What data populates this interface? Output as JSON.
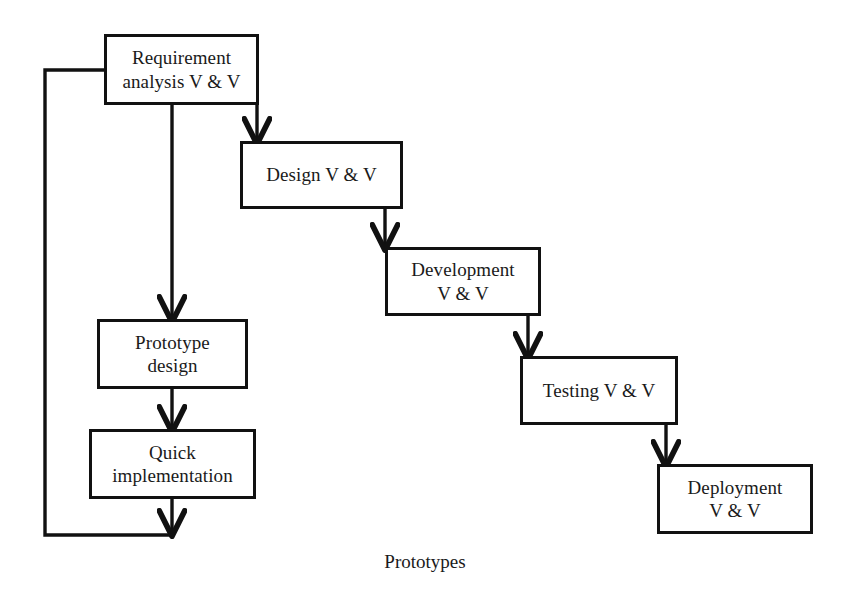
{
  "diagram": {
    "caption": "Prototypes",
    "stroke_color": "#111111",
    "background_color": "#ffffff",
    "nodes": [
      {
        "id": "requirement-analysis",
        "label": "Requirement\nanalysis V & V",
        "x": 104,
        "y": 34,
        "width": 155,
        "height": 71
      },
      {
        "id": "design",
        "label": "Design V & V",
        "x": 240,
        "y": 141,
        "width": 163,
        "height": 68
      },
      {
        "id": "development",
        "label": "Development\nV & V",
        "x": 385,
        "y": 247,
        "width": 156,
        "height": 69
      },
      {
        "id": "testing",
        "label": "Testing V & V",
        "x": 520,
        "y": 356,
        "width": 158,
        "height": 69
      },
      {
        "id": "deployment",
        "label": "Deployment\nV & V",
        "x": 657,
        "y": 464,
        "width": 156,
        "height": 70
      },
      {
        "id": "prototype-design",
        "label": "Prototype\ndesign",
        "x": 97,
        "y": 319,
        "width": 151,
        "height": 70
      },
      {
        "id": "quick-implementation",
        "label": "Quick\nimplementation",
        "x": 89,
        "y": 429,
        "width": 167,
        "height": 70
      }
    ],
    "edges": [
      {
        "id": "requirement-to-design",
        "from": "requirement-analysis",
        "to": "design",
        "arrow": true
      },
      {
        "id": "design-to-development",
        "from": "design",
        "to": "development",
        "arrow": true
      },
      {
        "id": "development-to-testing",
        "from": "development",
        "to": "testing",
        "arrow": true
      },
      {
        "id": "testing-to-deployment",
        "from": "testing",
        "to": "deployment",
        "arrow": true
      },
      {
        "id": "requirement-to-prototype-design",
        "from": "requirement-analysis",
        "to": "prototype-design",
        "arrow": true
      },
      {
        "id": "prototype-design-to-quick-implementation",
        "from": "prototype-design",
        "to": "quick-implementation",
        "arrow": true
      },
      {
        "id": "quick-implementation-feedback-to-requirement",
        "from": "quick-implementation",
        "to": "requirement-analysis",
        "arrow": true
      }
    ]
  }
}
